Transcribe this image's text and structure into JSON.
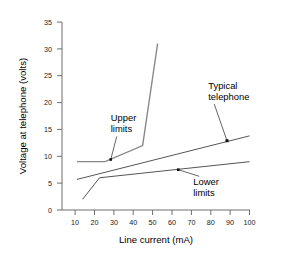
{
  "chart_data": {
    "type": "line",
    "title": "",
    "xlabel": "Line current (mA)",
    "ylabel": "Voltage at telephone (volts)",
    "xlim": [
      0,
      100
    ],
    "ylim": [
      0,
      35
    ],
    "xticks": [
      10,
      20,
      30,
      40,
      50,
      60,
      70,
      80,
      90,
      100
    ],
    "yticks": [
      0,
      5,
      10,
      15,
      20,
      25,
      30,
      35
    ],
    "grid": false,
    "legend": "none",
    "series": [
      {
        "name": "Upper limits",
        "points": [
          [
            8,
            9
          ],
          [
            23,
            9
          ],
          [
            43,
            12
          ],
          [
            51,
            31
          ]
        ]
      },
      {
        "name": "Typical telephone",
        "points": [
          [
            8,
            5.7
          ],
          [
            100,
            13.8
          ]
        ]
      },
      {
        "name": "Lower limits",
        "points": [
          [
            11,
            2
          ],
          [
            20,
            6
          ],
          [
            100,
            9
          ]
        ]
      }
    ],
    "annotations": [
      {
        "label_line1": "Upper",
        "label_line2": "limits",
        "text_x": 26,
        "text_y": 16.5,
        "point_x": 26,
        "point_y": 9.4,
        "marker": "dot"
      },
      {
        "label_line1": "Typical",
        "label_line2": "telephone",
        "text_x": 78,
        "text_y": 22.5,
        "point_x": 88,
        "point_y": 12.9,
        "marker": "arrow"
      },
      {
        "label_line1": "Lower",
        "label_line2": "limits",
        "text_x": 70,
        "text_y": 4.6,
        "point_x": 62,
        "point_y": 7.5,
        "marker": "dot"
      }
    ]
  },
  "labels": {
    "x_axis_title": "Line current (mA)",
    "y_axis_title": "Voltage at telephone (volts)",
    "xtick_10": "10",
    "xtick_20": "20",
    "xtick_30": "30",
    "xtick_40": "40",
    "xtick_50": "50",
    "xtick_60": "60",
    "xtick_70": "70",
    "xtick_80": "80",
    "xtick_90": "90",
    "xtick_100": "100",
    "ytick_0": "0",
    "ytick_5": "5",
    "ytick_10": "10",
    "ytick_15": "15",
    "ytick_20": "20",
    "ytick_25": "25",
    "ytick_30": "30",
    "ytick_35": "35",
    "annot_upper_1": "Upper",
    "annot_upper_2": "limits",
    "annot_typical_1": "Typical",
    "annot_typical_2": "telephone",
    "annot_lower_1": "Lower",
    "annot_lower_2": "limits"
  },
  "colors": {
    "background": "#ffffff",
    "axis": "#6e6e6e",
    "curve": "#555555",
    "curve_flat": "#888888",
    "text": "#000000"
  }
}
